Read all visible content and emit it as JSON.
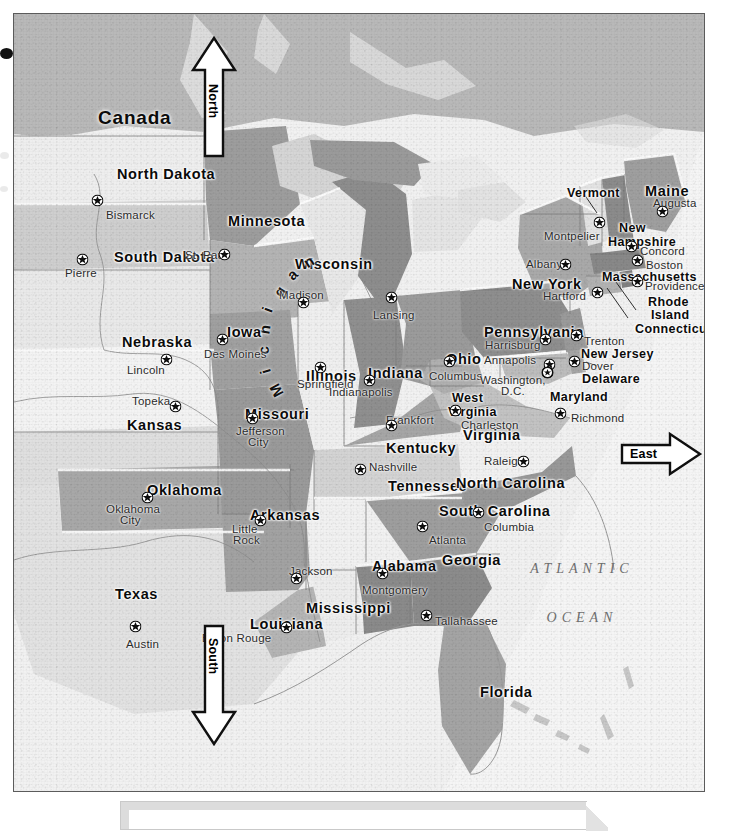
{
  "document": {
    "kind": "printed-atlas-page",
    "region_shown": "Eastern United States",
    "ocean_label": "ATLANTIC OCEAN"
  },
  "compass": {
    "north": "North",
    "south": "South",
    "east": "East"
  },
  "labels": {
    "country": [
      {
        "name": "Canada",
        "x": 84,
        "y": 94
      }
    ],
    "ocean": [
      {
        "line": "ATLANTIC",
        "x": 568,
        "y": 548
      },
      {
        "line": "OCEAN",
        "x": 568,
        "y": 597
      }
    ]
  },
  "states": [
    {
      "name": "North Dakota",
      "x": 103,
      "y": 153,
      "size": "md",
      "anchor": "left"
    },
    {
      "name": "South Dakota",
      "x": 100,
      "y": 236,
      "size": "md",
      "anchor": "left"
    },
    {
      "name": "Minnesota",
      "x": 214,
      "y": 200,
      "size": "md",
      "anchor": "left"
    },
    {
      "name": "Wisconsin",
      "x": 281,
      "y": 243,
      "size": "md",
      "anchor": "left"
    },
    {
      "name": "Michigan",
      "x": 348,
      "y": 243,
      "size": "arc",
      "anchor": "arc"
    },
    {
      "name": "Nebraska",
      "x": 108,
      "y": 321,
      "size": "md",
      "anchor": "left"
    },
    {
      "name": "Iowa",
      "x": 213,
      "y": 311,
      "size": "md",
      "anchor": "left"
    },
    {
      "name": "Kansas",
      "x": 113,
      "y": 404,
      "size": "md",
      "anchor": "left"
    },
    {
      "name": "Missouri",
      "x": 231,
      "y": 393,
      "size": "md",
      "anchor": "left"
    },
    {
      "name": "Illinois",
      "x": 292,
      "y": 355,
      "size": "md",
      "anchor": "left"
    },
    {
      "name": "Indiana",
      "x": 354,
      "y": 352,
      "size": "md",
      "anchor": "left"
    },
    {
      "name": "Ohio",
      "x": 432,
      "y": 338,
      "size": "md",
      "anchor": "left"
    },
    {
      "name": "Kentucky",
      "x": 372,
      "y": 427,
      "size": "md",
      "anchor": "left"
    },
    {
      "name": "Tennessee",
      "x": 374,
      "y": 465,
      "size": "md",
      "anchor": "left"
    },
    {
      "name": "Oklahoma",
      "x": 133,
      "y": 469,
      "size": "md",
      "anchor": "left"
    },
    {
      "name": "Arkansas",
      "x": 236,
      "y": 494,
      "size": "md",
      "anchor": "left"
    },
    {
      "name": "Texas",
      "x": 101,
      "y": 573,
      "size": "md",
      "anchor": "left"
    },
    {
      "name": "Louisiana",
      "x": 236,
      "y": 603,
      "size": "md",
      "anchor": "left"
    },
    {
      "name": "Mississippi",
      "x": 292,
      "y": 587,
      "size": "md",
      "anchor": "left"
    },
    {
      "name": "Alabama",
      "x": 358,
      "y": 545,
      "size": "md",
      "anchor": "left"
    },
    {
      "name": "Georgia",
      "x": 428,
      "y": 539,
      "size": "md",
      "anchor": "left"
    },
    {
      "name": "Florida",
      "x": 466,
      "y": 671,
      "size": "md",
      "anchor": "left"
    },
    {
      "name": "South Carolina",
      "x": 425,
      "y": 490,
      "size": "md",
      "anchor": "left"
    },
    {
      "name": "North Carolina",
      "x": 442,
      "y": 462,
      "size": "md",
      "anchor": "left"
    },
    {
      "name": "Virginia",
      "x": 449,
      "y": 414,
      "size": "md",
      "anchor": "left"
    },
    {
      "name": "West",
      "x": 438,
      "y": 378,
      "size": "sm",
      "anchor": "left"
    },
    {
      "name": "Virginia",
      "x": 434,
      "y": 392,
      "size": "sm",
      "anchor": "left"
    },
    {
      "name": "Maryland",
      "x": 536,
      "y": 377,
      "size": "sm",
      "anchor": "left"
    },
    {
      "name": "Delaware",
      "x": 568,
      "y": 359,
      "size": "sm",
      "anchor": "left"
    },
    {
      "name": "New Jersey",
      "x": 567,
      "y": 334,
      "size": "sm",
      "anchor": "left"
    },
    {
      "name": "Pennsylvania",
      "x": 470,
      "y": 311,
      "size": "md",
      "anchor": "left"
    },
    {
      "name": "New York",
      "x": 498,
      "y": 263,
      "size": "md",
      "anchor": "left"
    },
    {
      "name": "Connecticut",
      "x": 621,
      "y": 309,
      "size": "sm",
      "anchor": "left"
    },
    {
      "name": "Rhode",
      "x": 634,
      "y": 282,
      "size": "sm",
      "anchor": "left"
    },
    {
      "name": "Island",
      "x": 637,
      "y": 295,
      "size": "sm",
      "anchor": "left"
    },
    {
      "name": "Massachusetts",
      "x": 588,
      "y": 257,
      "size": "sm",
      "anchor": "left"
    },
    {
      "name": "New",
      "x": 605,
      "y": 208,
      "size": "sm",
      "anchor": "left"
    },
    {
      "name": "Hampshire",
      "x": 594,
      "y": 222,
      "size": "sm",
      "anchor": "left"
    },
    {
      "name": "Vermont",
      "x": 553,
      "y": 173,
      "size": "sm",
      "anchor": "left"
    },
    {
      "name": "Maine",
      "x": 631,
      "y": 170,
      "size": "md",
      "anchor": "left"
    }
  ],
  "cities": [
    {
      "name": "Bismarck",
      "lx": 92,
      "ly": 196,
      "sx": 83,
      "sy": 186,
      "anchor": "left"
    },
    {
      "name": "Pierre",
      "lx": 51,
      "ly": 254,
      "sx": 68,
      "sy": 245,
      "anchor": "left"
    },
    {
      "name": "St. Paul",
      "lx": 171,
      "ly": 236,
      "sx": 210,
      "sy": 240,
      "anchor": "left"
    },
    {
      "name": "Madison",
      "lx": 265,
      "ly": 276,
      "sx": 289,
      "sy": 288,
      "anchor": "left"
    },
    {
      "name": "Lansing",
      "lx": 359,
      "ly": 296,
      "sx": 377,
      "sy": 283,
      "anchor": "left"
    },
    {
      "name": "Des Moines",
      "lx": 190,
      "ly": 335,
      "sx": 208,
      "sy": 325,
      "anchor": "left"
    },
    {
      "name": "Lincoln",
      "lx": 113,
      "ly": 351,
      "sx": 152,
      "sy": 345,
      "anchor": "left"
    },
    {
      "name": "Topeka",
      "lx": 118,
      "ly": 382,
      "sx": 161,
      "sy": 392,
      "anchor": "left"
    },
    {
      "name": "Springfield",
      "lx": 283,
      "ly": 365,
      "sx": 306,
      "sy": 353,
      "anchor": "left"
    },
    {
      "name": "Jefferson",
      "lx": 222,
      "ly": 412,
      "sx": 238,
      "sy": 404,
      "anchor": "left"
    },
    {
      "name": "City",
      "lx": 234,
      "ly": 423,
      "sx": null,
      "sy": null,
      "anchor": "left"
    },
    {
      "name": "Indianapolis",
      "lx": 315,
      "ly": 373,
      "sx": 355,
      "sy": 366,
      "anchor": "left"
    },
    {
      "name": "Columbus",
      "lx": 415,
      "ly": 357,
      "sx": 435,
      "sy": 347,
      "anchor": "left"
    },
    {
      "name": "Frankfort",
      "lx": 372,
      "ly": 401,
      "sx": 377,
      "sy": 411,
      "anchor": "left"
    },
    {
      "name": "Charleston",
      "lx": 447,
      "ly": 406,
      "sx": 441,
      "sy": 396,
      "anchor": "left"
    },
    {
      "name": "Richmond",
      "lx": 557,
      "ly": 399,
      "sx": 546,
      "sy": 399,
      "anchor": "left"
    },
    {
      "name": "Nashville",
      "lx": 355,
      "ly": 448,
      "sx": 346,
      "sy": 455,
      "anchor": "left"
    },
    {
      "name": "Raleigh",
      "lx": 470,
      "ly": 442,
      "sx": 509,
      "sy": 447,
      "anchor": "left"
    },
    {
      "name": "Columbia",
      "lx": 470,
      "ly": 508,
      "sx": 464,
      "sy": 498,
      "anchor": "left"
    },
    {
      "name": "Atlanta",
      "lx": 415,
      "ly": 521,
      "sx": 408,
      "sy": 512,
      "anchor": "left"
    },
    {
      "name": "Montgomery",
      "lx": 348,
      "ly": 571,
      "sx": 368,
      "sy": 559,
      "anchor": "left"
    },
    {
      "name": "Tallahassee",
      "lx": 421,
      "ly": 602,
      "sx": 412,
      "sy": 601,
      "anchor": "left"
    },
    {
      "name": "Jackson",
      "lx": 275,
      "ly": 552,
      "sx": 282,
      "sy": 564,
      "anchor": "left"
    },
    {
      "name": "Baton Rouge",
      "lx": 188,
      "ly": 619,
      "sx": 272,
      "sy": 613,
      "anchor": "left"
    },
    {
      "name": "Little",
      "lx": 218,
      "ly": 510,
      "sx": 246,
      "sy": 506,
      "anchor": "left"
    },
    {
      "name": "Rock",
      "lx": 219,
      "ly": 521,
      "sx": null,
      "sy": null,
      "anchor": "left"
    },
    {
      "name": "Oklahoma",
      "lx": 92,
      "ly": 490,
      "sx": 133,
      "sy": 483,
      "anchor": "left"
    },
    {
      "name": "City",
      "lx": 106,
      "ly": 501,
      "sx": null,
      "sy": null,
      "anchor": "left"
    },
    {
      "name": "Austin",
      "lx": 112,
      "ly": 625,
      "sx": 121,
      "sy": 612,
      "anchor": "left"
    },
    {
      "name": "Harrisburg",
      "lx": 471,
      "ly": 326,
      "sx": 531,
      "sy": 325,
      "anchor": "left"
    },
    {
      "name": "Annapolis",
      "lx": 470,
      "ly": 341,
      "sx": 535,
      "sy": 350,
      "anchor": "left"
    },
    {
      "name": "Washington,",
      "lx": 466,
      "ly": 361,
      "sx": 533,
      "sy": 358,
      "anchor": "left"
    },
    {
      "name": "D.C.",
      "lx": 487,
      "ly": 372,
      "sx": null,
      "sy": null,
      "anchor": "left"
    },
    {
      "name": "Dover",
      "lx": 568,
      "ly": 347,
      "sx": 560,
      "sy": 347,
      "anchor": "left"
    },
    {
      "name": "Trenton",
      "lx": 570,
      "ly": 322,
      "sx": 562,
      "sy": 321,
      "anchor": "left"
    },
    {
      "name": "Hartford",
      "lx": 529,
      "ly": 277,
      "sx": 583,
      "sy": 278,
      "anchor": "left"
    },
    {
      "name": "Providence",
      "lx": 631,
      "ly": 267,
      "sx": 623,
      "sy": 267,
      "anchor": "left"
    },
    {
      "name": "Boston",
      "lx": 632,
      "ly": 246,
      "sx": 623,
      "sy": 246,
      "anchor": "left"
    },
    {
      "name": "Concord",
      "lx": 626,
      "ly": 232,
      "sx": 617,
      "sy": 232,
      "anchor": "left"
    },
    {
      "name": "Augusta",
      "lx": 639,
      "ly": 184,
      "sx": 648,
      "sy": 197,
      "anchor": "left"
    },
    {
      "name": "Albany",
      "lx": 512,
      "ly": 245,
      "sx": 551,
      "sy": 250,
      "anchor": "left"
    },
    {
      "name": "Montpelier",
      "lx": 530,
      "ly": 217,
      "sx": 585,
      "sy": 208,
      "anchor": "left"
    }
  ]
}
